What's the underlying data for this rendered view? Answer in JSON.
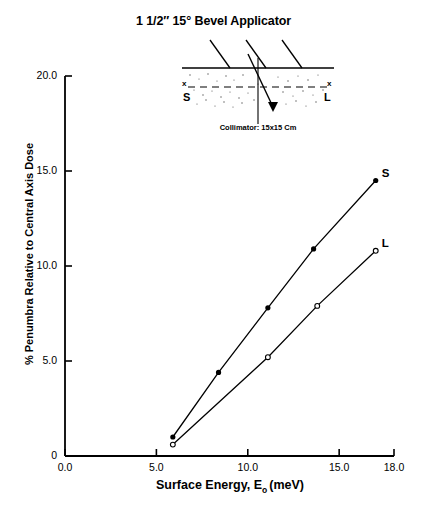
{
  "title": {
    "prefix": "1 1/2″ 15",
    "degree": "°",
    "suffix": "Bevel Applicator",
    "full": "1 1/2″ 15° Bevel Applicator"
  },
  "inset": {
    "caption": "Collimator: 15x15 Cm",
    "left_marker": "S",
    "right_marker": "L",
    "axis_marker_left": "x",
    "axis_marker_right": "x"
  },
  "axes": {
    "x_title_main": "Surface Energy, E",
    "x_title_sub": "o",
    "x_title_unit": "(meV)",
    "y_title": "% Penumbra Relative to Central Axis Dose"
  },
  "chart_data": {
    "type": "line",
    "title": "1 1/2″ 15° Bevel Applicator",
    "xlabel": "Surface Energy, Eo (meV)",
    "ylabel": "% Penumbra Relative to Central Axis Dose",
    "xlim": [
      0.0,
      18.0
    ],
    "ylim": [
      0.0,
      20.0
    ],
    "xticks": [
      "0.0",
      "5.0",
      "10.0",
      "15.0",
      "18.0"
    ],
    "xtick_values": [
      0.0,
      5.0,
      10.0,
      15.0,
      18.0
    ],
    "yticks": [
      "0",
      "5.0",
      "10.0",
      "15.0",
      "20.0"
    ],
    "ytick_values": [
      0.0,
      5.0,
      10.0,
      15.0,
      20.0
    ],
    "grid": false,
    "legend": "inline-end-labels",
    "series": [
      {
        "name": "S",
        "marker": "filled-circle",
        "x": [
          5.9,
          8.4,
          11.1,
          13.6,
          17.0
        ],
        "y": [
          1.0,
          4.4,
          7.8,
          10.9,
          14.5
        ]
      },
      {
        "name": "L",
        "marker": "open-circle",
        "x": [
          5.9,
          11.1,
          13.8,
          17.0
        ],
        "y": [
          0.6,
          5.2,
          7.9,
          10.8
        ]
      }
    ]
  }
}
